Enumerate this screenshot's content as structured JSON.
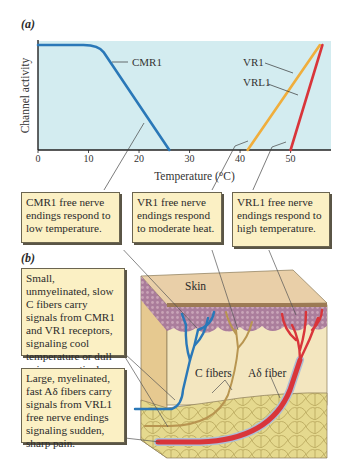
{
  "panel_a": {
    "label": "(a)",
    "chart_data": {
      "type": "line",
      "title": "",
      "xlabel": "Temperature (°C)",
      "ylabel": "Channel activity",
      "xlim": [
        0,
        58
      ],
      "ylim": [
        0,
        1
      ],
      "xticks": [
        0,
        10,
        20,
        30,
        40,
        50
      ],
      "xtick_labels": [
        "0",
        "10",
        "20",
        "30",
        "40",
        "50"
      ],
      "grid": false,
      "background": "#d3ecf0",
      "series": [
        {
          "name": "CMR1",
          "color": "#2a78b8",
          "x": [
            0,
            9,
            11,
            13,
            26
          ],
          "y": [
            1.0,
            1.0,
            0.99,
            0.93,
            0.0
          ]
        },
        {
          "name": "VR1",
          "color": "#f0ae3c",
          "x": [
            41.5,
            55.8
          ],
          "y": [
            0.0,
            1.0
          ]
        },
        {
          "name": "VRL1",
          "color": "#d9353a",
          "x": [
            50,
            56.3
          ],
          "y": [
            0.0,
            1.0
          ]
        }
      ],
      "annotations": [
        {
          "text": "CMR1",
          "target": "CMR1"
        },
        {
          "text": "VR1",
          "target": "VR1"
        },
        {
          "text": "VRL1",
          "target": "VRL1"
        }
      ]
    }
  },
  "callouts": {
    "cmr1": "CMR1 free nerve endings respond to low temperature.",
    "vr1": "VR1 free nerve endings respond to moderate heat.",
    "vrl1": "VRL1 free nerve endings respond to high temperature.",
    "c_fibers": "Small, unmyelinated, slow C fibers carry signals from CMR1 and VR1 receptors, signaling cool temperature or dull pain, respectively.",
    "a_delta": "Large, myelinated, fast Aδ fibers carry signals from VRL1 free nerve endings signaling sudden, sharp pain."
  },
  "panel_b": {
    "label": "(b)",
    "skin_label": "Skin",
    "c_fibers_label": "C fibers",
    "a_delta_label": "Aδ fiber",
    "colors": {
      "cmr1_fiber": "#2a78b8",
      "vr1_fiber": "#b89550",
      "vrl1_fiber": "#d9353a",
      "epidermis": "#e9cfa8",
      "dermis": "#f3e6bf",
      "fat": "#e7dc96"
    }
  }
}
